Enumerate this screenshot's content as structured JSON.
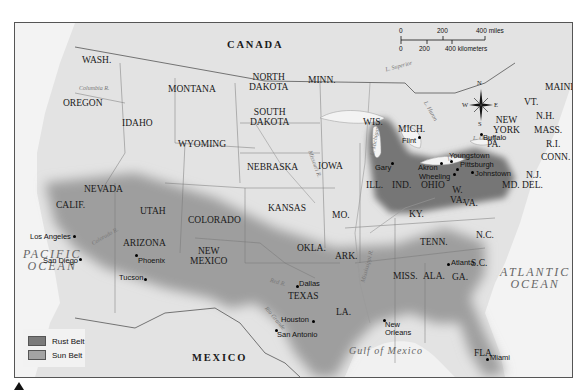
{
  "map": {
    "colors": {
      "land": "#e6e6e6",
      "water": "#f3f3f3",
      "rust_belt": "#7a7a7a",
      "sun_belt": "#9e9e9e",
      "border": "#555555"
    },
    "countries": {
      "canada": "CANADA",
      "mexico": "MEXICO"
    },
    "oceans": {
      "pacific": [
        "PACIFIC",
        "OCEAN"
      ],
      "atlantic": [
        "ATLANTIC",
        "OCEAN"
      ],
      "gulf": "Gulf of Mexico"
    },
    "states": {
      "wash": "WASH.",
      "oregon": "OREGON",
      "idaho": "IDAHO",
      "montana": "MONTANA",
      "wyoming": "WYOMING",
      "nevada": "NEVADA",
      "utah": "UTAH",
      "colorado": "COLORADO",
      "calif": "CALIF.",
      "arizona": "ARIZONA",
      "new_mexico_1": "NEW",
      "new_mexico_2": "MEXICO",
      "north_dakota_1": "NORTH",
      "north_dakota_2": "DAKOTA",
      "south_dakota_1": "SOUTH",
      "south_dakota_2": "DAKOTA",
      "nebraska": "NEBRASKA",
      "kansas": "KANSAS",
      "okla": "OKLA.",
      "texas": "TEXAS",
      "minn": "MINN.",
      "iowa": "IOWA",
      "mo": "MO.",
      "ark": "ARK.",
      "la": "LA.",
      "wis": "WIS.",
      "ill": "ILL.",
      "mich": "MICH.",
      "ind": "IND.",
      "ohio": "OHIO",
      "ky": "KY.",
      "tenn": "TENN.",
      "miss": "MISS.",
      "ala": "ALA.",
      "ga": "GA.",
      "fla": "FLA.",
      "sc": "S.C.",
      "nc": "N.C.",
      "va": "VA.",
      "wva_1": "W.",
      "wva_2": "VA.",
      "pa": "PA.",
      "ny_1": "NEW",
      "ny_2": "YORK",
      "md": "MD.",
      "del": "DEL.",
      "nj": "N.J.",
      "conn": "CONN.",
      "ri": "R.I.",
      "mass": "MASS.",
      "vt": "VT.",
      "nh": "N.H.",
      "maine": "MAINE"
    },
    "rivers": {
      "columbia": "Columbia R.",
      "missouri": "Missouri R.",
      "mississippi": "Mississippi R.",
      "ohio": "Ohio R.",
      "red": "Red R.",
      "rio_grande": "Rio Grande",
      "colorado": "Colorado R."
    },
    "lakes": {
      "superior": "L. Superior",
      "michigan": "L. Michigan",
      "huron": "L. Huron",
      "erie": "L. Erie",
      "ontario": "L. Ontario"
    },
    "cities": [
      {
        "name": "Los Angeles"
      },
      {
        "name": "San Diego"
      },
      {
        "name": "Phoenix"
      },
      {
        "name": "Tucson"
      },
      {
        "name": "Dallas"
      },
      {
        "name": "Houston"
      },
      {
        "name": "San Antonio"
      },
      {
        "name": "New Orleans"
      },
      {
        "name": "Atlanta"
      },
      {
        "name": "Miami"
      },
      {
        "name": "Gary"
      },
      {
        "name": "Flint"
      },
      {
        "name": "Akron"
      },
      {
        "name": "Wheeling"
      },
      {
        "name": "Youngstown"
      },
      {
        "name": "Pittsburgh"
      },
      {
        "name": "Johnstown"
      },
      {
        "name": "Buffalo"
      }
    ],
    "legend": [
      {
        "label": "Rust Belt",
        "color": "#7a7a7a"
      },
      {
        "label": "Sun Belt",
        "color": "#a3a3a3"
      }
    ],
    "scale": {
      "miles": [
        "0",
        "200",
        "400 miles"
      ],
      "kilometers": [
        "0",
        "200",
        "400 kilometers"
      ]
    },
    "compass": {
      "n": "N",
      "s": "S",
      "e": "E",
      "w": "W"
    }
  }
}
